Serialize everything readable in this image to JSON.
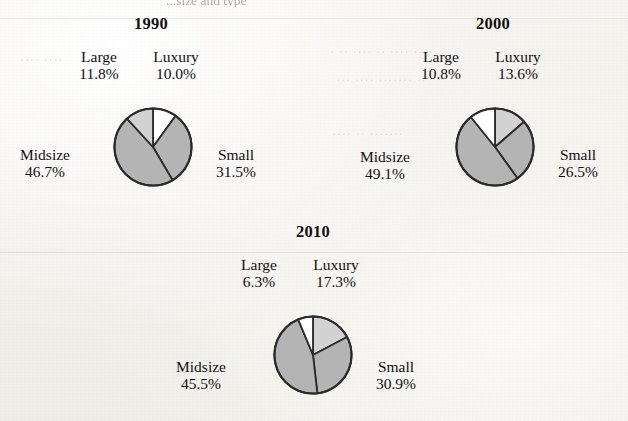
{
  "page": {
    "clipped_header_text": "...size and type",
    "background_color": "#f4f2ed",
    "text_color": "#111111"
  },
  "palette": {
    "gray": "#b4b4b4",
    "light_gray": "#d2d2d2",
    "white": "#ffffff",
    "outline": "#2b2b2b"
  },
  "chart_data": [
    {
      "type": "pie",
      "title": "1990",
      "categories": [
        "Luxury",
        "Small",
        "Midsize",
        "Large"
      ],
      "values": [
        10.0,
        31.5,
        46.7,
        11.8
      ],
      "labels": [
        "10.0%",
        "31.5%",
        "46.7%",
        "11.8%"
      ],
      "colors": [
        "#ffffff",
        "#b4b4b4",
        "#b4b4b4",
        "#d2d2d2"
      ],
      "start_angle": 0,
      "direction": "clockwise",
      "legend": "none",
      "grid": false,
      "slices": {
        "large": {
          "name": "Large",
          "pct": "11.8%",
          "value": 11.8,
          "color": "#d2d2d2"
        },
        "luxury": {
          "name": "Luxury",
          "pct": "10.0%",
          "value": 10.0,
          "color": "#ffffff"
        },
        "midsize": {
          "name": "Midsize",
          "pct": "46.7%",
          "value": 46.7,
          "color": "#b4b4b4"
        },
        "small": {
          "name": "Small",
          "pct": "31.5%",
          "value": 31.5,
          "color": "#b4b4b4"
        }
      }
    },
    {
      "type": "pie",
      "title": "2000",
      "categories": [
        "Luxury",
        "Small",
        "Midsize",
        "Large"
      ],
      "values": [
        13.6,
        26.5,
        49.1,
        10.8
      ],
      "labels": [
        "13.6%",
        "26.5%",
        "49.1%",
        "10.8%"
      ],
      "colors": [
        "#d2d2d2",
        "#b4b4b4",
        "#b4b4b4",
        "#ffffff"
      ],
      "start_angle": 0,
      "direction": "clockwise",
      "legend": "none",
      "grid": false,
      "slices": {
        "large": {
          "name": "Large",
          "pct": "10.8%",
          "value": 10.8,
          "color": "#ffffff"
        },
        "luxury": {
          "name": "Luxury",
          "pct": "13.6%",
          "value": 13.6,
          "color": "#d2d2d2"
        },
        "midsize": {
          "name": "Midsize",
          "pct": "49.1%",
          "value": 49.1,
          "color": "#b4b4b4"
        },
        "small": {
          "name": "Small",
          "pct": "26.5%",
          "value": 26.5,
          "color": "#b4b4b4"
        }
      }
    },
    {
      "type": "pie",
      "title": "2010",
      "categories": [
        "Luxury",
        "Small",
        "Midsize",
        "Large"
      ],
      "values": [
        17.3,
        30.9,
        45.5,
        6.3
      ],
      "labels": [
        "17.3%",
        "30.9%",
        "45.5%",
        "6.3%"
      ],
      "colors": [
        "#d2d2d2",
        "#b4b4b4",
        "#b4b4b4",
        "#ffffff"
      ],
      "start_angle": 0,
      "direction": "clockwise",
      "legend": "none",
      "grid": false,
      "slices": {
        "large": {
          "name": "Large",
          "pct": "6.3%",
          "value": 6.3,
          "color": "#ffffff"
        },
        "luxury": {
          "name": "Luxury",
          "pct": "17.3%",
          "value": 17.3,
          "color": "#d2d2d2"
        },
        "midsize": {
          "name": "Midsize",
          "pct": "45.5%",
          "value": 45.5,
          "color": "#b4b4b4"
        },
        "small": {
          "name": "Small",
          "pct": "30.9%",
          "value": 30.9,
          "color": "#b4b4b4"
        }
      }
    }
  ]
}
